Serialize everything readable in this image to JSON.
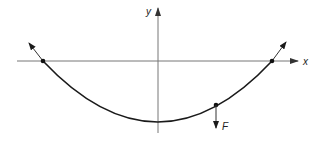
{
  "diagram": {
    "type": "parabola-with-force",
    "axes": {
      "x_label": "x",
      "y_label": "y"
    },
    "curve": "parabola opening upward, vertex below x-axis on y-axis",
    "points": [
      {
        "name": "left-intersection",
        "on": "x-axis",
        "tangent_arrow": "up-left"
      },
      {
        "name": "right-intersection",
        "on": "x-axis",
        "tangent_arrow": "up-right"
      },
      {
        "name": "force-point",
        "on": "curve",
        "force_arrow": "down"
      }
    ],
    "force_label": "F",
    "colors": {
      "axis": "#777777",
      "curve": "#1a1a1a",
      "background": "#ffffff"
    }
  }
}
